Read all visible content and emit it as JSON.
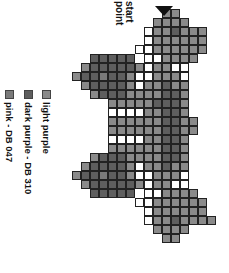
{
  "start_label": "start\npoint",
  "legend": [
    {
      "label": "light purple",
      "color": "#8a8a8a",
      "key": "L"
    },
    {
      "label": "dark purple - DB 310",
      "color": "#5e5e5e",
      "key": "D"
    },
    {
      "label": "pink - DB 047",
      "color": "#7a7a7a",
      "key": "P"
    }
  ],
  "grid": {
    "cell_size": 9,
    "rows": [
      "...........LL.....",
      "..........LLLL....",
      ".........WLLDLLL..",
      ".........WLLLLLL..",
      "........WWLLLLLL..",
      "...DDDDD.WWLLLL...",
      "..LDDDDDLWLLWW....",
      ".LDDPDDLWWLLLW....",
      "..LDDDDLWLLDLL....",
      "...LDDDLLLLDDL....",
      ".....LLLLLDDDL....",
      ".....WWWWLLDDL....",
      ".....LLLLLLDDLL...",
      ".....LLLLLLDDLL...",
      ".....WWWWLLDDL....",
      ".....LLLLLLDDL....",
      "...LDDDLLLLDDL....",
      "..LDDDDLWLLDLL....",
      ".LDDPDDLWWLLLW....",
      "..LDDDDDLWLLWW....",
      "...DDDDD.WWLLLL...",
      "........WWLLLLLL..",
      ".........WLLLLLL..",
      ".........WLLDLLLL.",
      "..........LLLL....",
      "...........LL....."
    ]
  }
}
